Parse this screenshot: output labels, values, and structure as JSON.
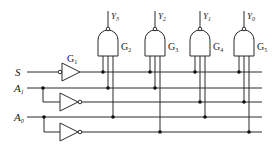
{
  "diagram": {
    "type": "logic-circuit",
    "colors": {
      "line": "#2a2a2a",
      "background": "#ffffff"
    },
    "inputs": [
      {
        "name": "S",
        "main": "S",
        "sub": ""
      },
      {
        "name": "A1",
        "main": "A",
        "sub": "1"
      },
      {
        "name": "A0",
        "main": "A",
        "sub": "0"
      }
    ],
    "gates": [
      {
        "id": "G1",
        "main": "G",
        "sub": "1",
        "kind": "buffer-with-inverted-input"
      },
      {
        "id": "G2",
        "main": "G",
        "sub": "2",
        "kind": "nand3",
        "output": {
          "main": "Y",
          "sub": "3"
        }
      },
      {
        "id": "G3",
        "main": "G",
        "sub": "3",
        "kind": "nand3",
        "output": {
          "main": "Y",
          "sub": "2"
        }
      },
      {
        "id": "G4",
        "main": "G",
        "sub": "4",
        "kind": "nand3",
        "output": {
          "main": "Y",
          "sub": "1"
        }
      },
      {
        "id": "G5",
        "main": "G",
        "sub": "5",
        "kind": "nand3",
        "output": {
          "main": "Y",
          "sub": "0"
        }
      }
    ],
    "inverters": [
      {
        "input": "A1",
        "output": "A1-bar"
      },
      {
        "input": "A0",
        "output": "A0-bar"
      }
    ]
  }
}
